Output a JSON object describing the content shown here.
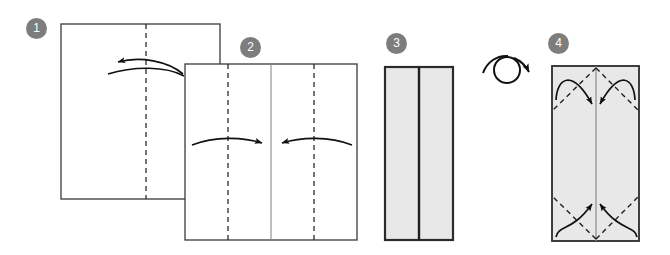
{
  "diagram": {
    "canvas": {
      "width": 670,
      "height": 255
    },
    "colors": {
      "badge_fill": "#7d7d7d",
      "badge_text": "#ffffff",
      "paper_outline": "#3a3a3a",
      "paper_fill_white": "#ffffff",
      "paper_fill_gray": "#e8e8e8",
      "fold_line": "#2b2b2b",
      "arrow": "#111111",
      "background": "#ffffff"
    },
    "steps": [
      {
        "number": "1",
        "badge_x": 26,
        "badge_y": 18,
        "shape": "square",
        "x": 61,
        "y": 24,
        "w": 159,
        "h": 175,
        "fill": "#ffffff",
        "fold_lines": [
          {
            "type": "dashed-vertical",
            "x": 146,
            "label": "center-vertical-crease"
          }
        ],
        "arrows": [
          {
            "type": "fold-left",
            "label": "fold-right-half-to-left",
            "direction": "left"
          }
        ]
      },
      {
        "number": "2",
        "badge_x": 240,
        "badge_y": 37,
        "shape": "square",
        "x": 185,
        "y": 64,
        "w": 172,
        "h": 176,
        "fill": "#ffffff",
        "fold_lines": [
          {
            "type": "solid-vertical",
            "x": 271,
            "label": "center-vertical-crease"
          },
          {
            "type": "dashed-vertical",
            "x": 228,
            "label": "left-quarter-crease"
          },
          {
            "type": "dashed-vertical",
            "x": 314,
            "label": "right-quarter-crease"
          }
        ],
        "arrows": [
          {
            "type": "fold-right",
            "label": "fold-left-edge-to-center",
            "direction": "right"
          },
          {
            "type": "fold-left",
            "label": "fold-right-edge-to-center",
            "direction": "left"
          }
        ]
      },
      {
        "number": "3",
        "badge_x": 386,
        "badge_y": 33,
        "shape": "rectangle",
        "x": 385,
        "y": 67,
        "w": 68,
        "h": 173,
        "fill": "#e8e8e8",
        "fold_lines": [
          {
            "type": "solid-thick-vertical",
            "x": 419,
            "label": "center-seam"
          }
        ],
        "arrows": []
      },
      {
        "number": "4",
        "badge_x": 548,
        "badge_y": 33,
        "shape": "rectangle",
        "x": 552,
        "y": 66,
        "w": 87,
        "h": 175,
        "fill": "#e8e8e8",
        "fold_lines": [
          {
            "type": "solid-vertical",
            "x": 596,
            "label": "center-seam"
          },
          {
            "type": "dashed-diagonal",
            "label": "top-left-corner-fold"
          },
          {
            "type": "dashed-diagonal",
            "label": "top-right-corner-fold"
          },
          {
            "type": "dashed-diagonal",
            "label": "bottom-left-corner-fold"
          },
          {
            "type": "dashed-diagonal",
            "label": "bottom-right-corner-fold"
          }
        ],
        "arrows": [
          {
            "type": "curved-in",
            "label": "top-left-flap-inward",
            "direction": "right-down"
          },
          {
            "type": "curved-in",
            "label": "top-right-flap-inward",
            "direction": "left-down"
          },
          {
            "type": "curved-in",
            "label": "bottom-left-flap-inward",
            "direction": "right-up"
          },
          {
            "type": "curved-in",
            "label": "bottom-right-flap-inward",
            "direction": "left-up"
          }
        ]
      }
    ],
    "rotation_symbol": {
      "label": "turn-over-rotate",
      "cx": 507,
      "cy": 70,
      "r": 13
    }
  }
}
